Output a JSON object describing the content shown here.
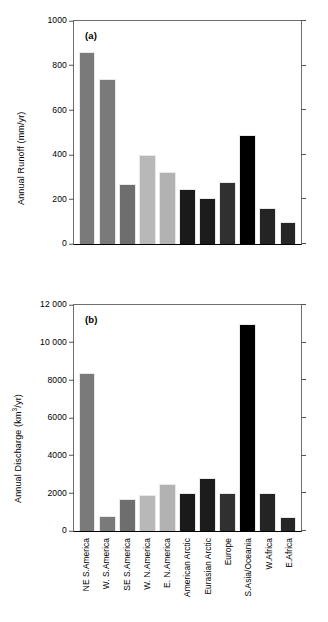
{
  "figure": {
    "background": "#ffffff",
    "categories": [
      "NE S.America",
      "W. S.America",
      "SE S.America",
      "W. N.America",
      "E. N.America",
      "American Arctic",
      "Eurasian Arctic",
      "Europe",
      "S.Asia/Oceania",
      "W.Africa",
      "E.Africa"
    ],
    "bar_colors": [
      "#7a7a7a",
      "#7a7a7a",
      "#6e6e6e",
      "#b8b8b8",
      "#b2b2b2",
      "#1a1a1a",
      "#1c1c1c",
      "#303030",
      "#000000",
      "#242424",
      "#262626"
    ]
  },
  "panel_a": {
    "tag": "(a)",
    "ylabel": "Annual Runoff (mm/yr)",
    "yticks": [
      "0",
      "200",
      "400",
      "600",
      "800",
      "1000"
    ]
  },
  "panel_b": {
    "tag": "(b)",
    "ylabel_pre": "Annual Discharge (km",
    "ylabel_sup": "3",
    "ylabel_post": "/yr)",
    "yticks": [
      "0",
      "2000",
      "4000",
      "6000",
      "8000",
      "10 000",
      "12 000"
    ]
  },
  "chart_data": [
    {
      "type": "bar",
      "panel": "(a)",
      "title": "",
      "xlabel": "",
      "ylabel": "Annual Runoff (mm/yr)",
      "ylim": [
        0,
        1000
      ],
      "ytick_values": [
        0,
        200,
        400,
        600,
        800,
        1000
      ],
      "grid": false,
      "legend": "none",
      "categories": [
        "NE S.America",
        "W. S.America",
        "SE S.America",
        "W. N.America",
        "E. N.America",
        "American Arctic",
        "Eurasian Arctic",
        "Europe",
        "S.Asia/Oceania",
        "W.Africa",
        "E.Africa"
      ],
      "values": [
        860,
        740,
        270,
        400,
        322,
        248,
        208,
        278,
        488,
        160,
        100
      ]
    },
    {
      "type": "bar",
      "panel": "(b)",
      "title": "",
      "xlabel": "",
      "ylabel": "Annual Discharge (km3/yr)",
      "ylim": [
        0,
        12000
      ],
      "ytick_values": [
        0,
        2000,
        4000,
        6000,
        8000,
        10000,
        12000
      ],
      "grid": false,
      "legend": "none",
      "categories": [
        "NE S.America",
        "W. S.America",
        "SE S.America",
        "W. N.America",
        "E. N.America",
        "American Arctic",
        "Eurasian Arctic",
        "Europe",
        "S.Asia/Oceania",
        "W.Africa",
        "E.Africa"
      ],
      "values": [
        8400,
        800,
        1700,
        1900,
        2500,
        2000,
        2800,
        2000,
        11000,
        2000,
        750
      ]
    }
  ]
}
